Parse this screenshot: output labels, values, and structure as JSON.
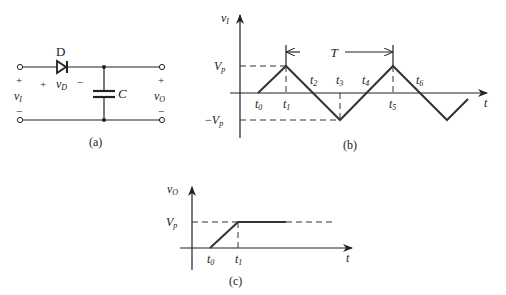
{
  "circuit_a": {
    "caption": "(a)",
    "diode_label": "D",
    "capacitor_label": "C",
    "input_voltage": {
      "symbol": "v",
      "subscript": "I"
    },
    "diode_voltage": {
      "symbol": "v",
      "subscript": "D"
    },
    "output_voltage": {
      "symbol": "v",
      "subscript": "O"
    },
    "plus": "+",
    "minus": "−"
  },
  "graph_b": {
    "caption": "(b)",
    "y_axis_label": {
      "symbol": "v",
      "subscript": "I"
    },
    "x_axis_label": "t",
    "vp_label": {
      "symbol": "V",
      "subscript": "p"
    },
    "neg_vp_label": {
      "prefix": "−",
      "symbol": "V",
      "subscript": "p"
    },
    "period_label": "T",
    "time_marks": [
      {
        "symbol": "t",
        "subscript": "0"
      },
      {
        "symbol": "t",
        "subscript": "1"
      },
      {
        "symbol": "t",
        "subscript": "2"
      },
      {
        "symbol": "t",
        "subscript": "3"
      },
      {
        "symbol": "t",
        "subscript": "4"
      },
      {
        "symbol": "t",
        "subscript": "5"
      },
      {
        "symbol": "t",
        "subscript": "6"
      }
    ]
  },
  "graph_c": {
    "caption": "(c)",
    "y_axis_label": {
      "symbol": "v",
      "subscript": "O"
    },
    "x_axis_label": "t",
    "vp_label": {
      "symbol": "V",
      "subscript": "p"
    },
    "time_marks": [
      {
        "symbol": "t",
        "subscript": "0"
      },
      {
        "symbol": "t",
        "subscript": "1"
      }
    ]
  }
}
